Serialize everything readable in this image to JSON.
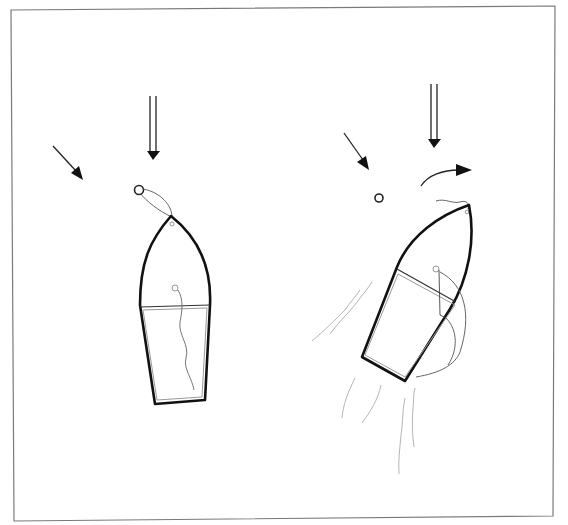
{
  "diagram": {
    "title": "",
    "colors": {
      "background": "#ffffff",
      "frame": "#7a7a7a",
      "hull": "#111111",
      "wake": "#b5b5b5"
    },
    "panels": [
      {
        "id": "left",
        "state": "moored to buoy, bow into current",
        "elements": [
          "wind-arrow",
          "current-arrow",
          "mooring-buoy",
          "mooring-line",
          "boat",
          "mast-line"
        ]
      },
      {
        "id": "right",
        "state": "boat swinging / turning away from buoy under power",
        "elements": [
          "wind-arrow",
          "current-arrow",
          "turn-arrow",
          "mooring-buoy",
          "boat",
          "sheet-line",
          "wake"
        ]
      }
    ]
  }
}
